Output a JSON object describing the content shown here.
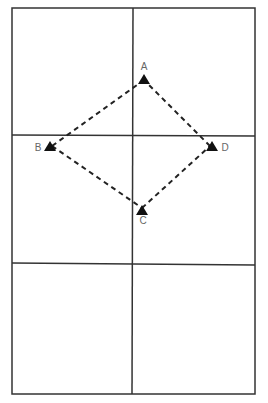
{
  "diagram": {
    "type": "field-layout",
    "grid": {
      "rows": 3,
      "cols": 2,
      "line_color": "#333333"
    },
    "points": [
      {
        "label": "A",
        "x": 144,
        "y": 78,
        "label_pos": "above"
      },
      {
        "label": "B",
        "x": 50,
        "y": 146,
        "label_pos": "left"
      },
      {
        "label": "C",
        "x": 142,
        "y": 210,
        "label_pos": "below"
      },
      {
        "label": "D",
        "x": 212,
        "y": 146,
        "label_pos": "right"
      }
    ],
    "connections": [
      [
        "A",
        "B"
      ],
      [
        "B",
        "C"
      ],
      [
        "C",
        "D"
      ],
      [
        "D",
        "A"
      ]
    ],
    "connection_style": "dashed",
    "marker": "filled-triangle",
    "marker_color": "#111111"
  }
}
